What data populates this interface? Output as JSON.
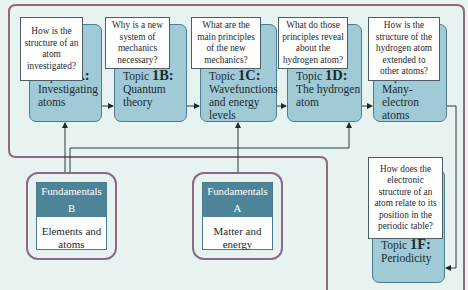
{
  "diagram": {
    "topics": [
      {
        "id": "1A",
        "prefix": "Topic ",
        "code": "1A",
        "suffix": ":",
        "title": "Investigating atoms",
        "question": "How is the structure of an atom investigated?"
      },
      {
        "id": "1B",
        "prefix": "Topic ",
        "code": "1B",
        "suffix": ":",
        "title": "Quantum theory",
        "question": "Why is a new system of mechanics necessary?"
      },
      {
        "id": "1C",
        "prefix": "Topic ",
        "code": "1C",
        "suffix": ":",
        "title": "Wavefunctions and energy levels",
        "question": "What are the main principles of the new mechanics?"
      },
      {
        "id": "1D",
        "prefix": "Topic ",
        "code": "1D",
        "suffix": ":",
        "title": "The hydrogen atom",
        "question": "What do those principles reveal about the hydrogen atom?"
      },
      {
        "id": "1E",
        "prefix": "Topic ",
        "code": "1E",
        "suffix": ":",
        "title": "Many-electron atoms",
        "question": "How is the structure of the hydrogen atom extended to other atoms?"
      },
      {
        "id": "1F",
        "prefix": "Topic ",
        "code": "1F",
        "suffix": ":",
        "title": "Periodicity",
        "question": "How does the electronic structure of an atom relate to its position in the periodic table?"
      }
    ],
    "fundamentals": [
      {
        "id": "B",
        "header": "Fundamentals B",
        "body": "Elements and atoms"
      },
      {
        "id": "A",
        "header": "Fundamentals A",
        "body": "Matter and energy"
      }
    ],
    "colors": {
      "background": "#e6f3f1",
      "topic_fill": "#9fcad6",
      "topic_border": "#4d7e8f",
      "frame": "#8c6a84",
      "fund_header": "#4e8497"
    }
  }
}
